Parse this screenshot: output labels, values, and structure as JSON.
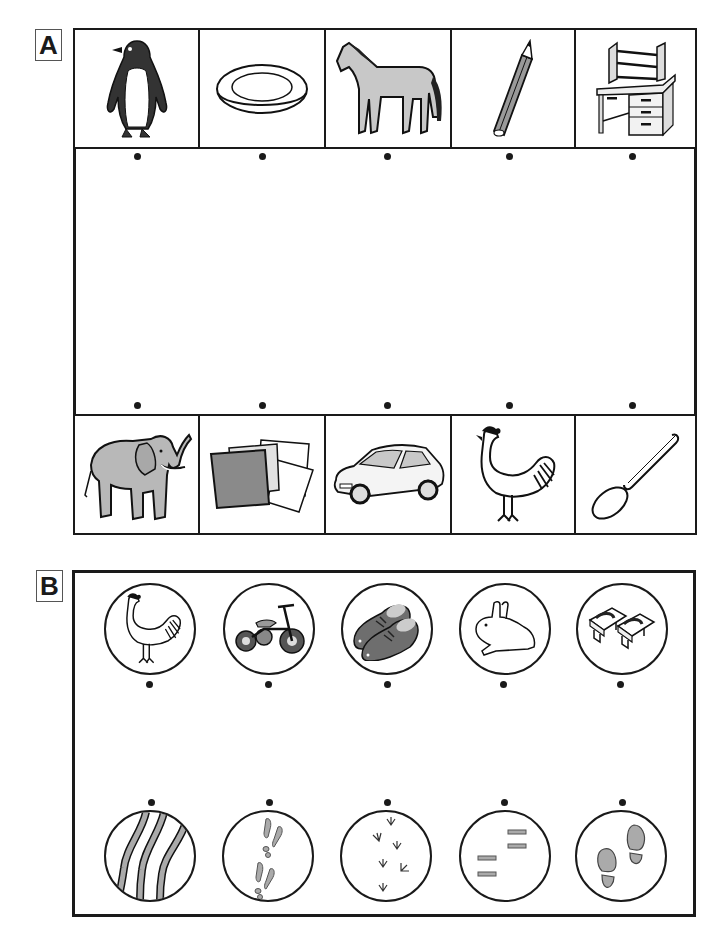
{
  "section_a": {
    "label": "A",
    "top_row": [
      {
        "name": "penguin",
        "icon": "penguin-icon"
      },
      {
        "name": "plate",
        "icon": "plate-icon"
      },
      {
        "name": "horse",
        "icon": "horse-icon"
      },
      {
        "name": "pencil",
        "icon": "pencil-icon"
      },
      {
        "name": "desk",
        "icon": "desk-icon"
      }
    ],
    "bottom_row": [
      {
        "name": "elephant",
        "icon": "elephant-icon"
      },
      {
        "name": "paper sheets",
        "icon": "paper-sheets-icon"
      },
      {
        "name": "car",
        "icon": "car-icon"
      },
      {
        "name": "rooster",
        "icon": "rooster-icon"
      },
      {
        "name": "spoon",
        "icon": "spoon-icon"
      }
    ]
  },
  "section_b": {
    "label": "B",
    "top_row": [
      {
        "name": "rooster",
        "icon": "rooster-icon"
      },
      {
        "name": "tricycle",
        "icon": "tricycle-icon"
      },
      {
        "name": "shoes",
        "icon": "shoes-icon"
      },
      {
        "name": "rabbit",
        "icon": "rabbit-icon"
      },
      {
        "name": "geta sandals",
        "icon": "geta-icon"
      }
    ],
    "bottom_row": [
      {
        "name": "tire tracks",
        "icon": "tire-tracks-icon"
      },
      {
        "name": "rabbit tracks",
        "icon": "rabbit-tracks-icon"
      },
      {
        "name": "bird tracks",
        "icon": "bird-tracks-icon"
      },
      {
        "name": "geta prints",
        "icon": "geta-prints-icon"
      },
      {
        "name": "shoe prints",
        "icon": "shoe-prints-icon"
      }
    ]
  },
  "colors": {
    "ink": "#1a1a1a",
    "gray_fill": "#b8b8b8",
    "dark_gray": "#6e6e6e"
  }
}
